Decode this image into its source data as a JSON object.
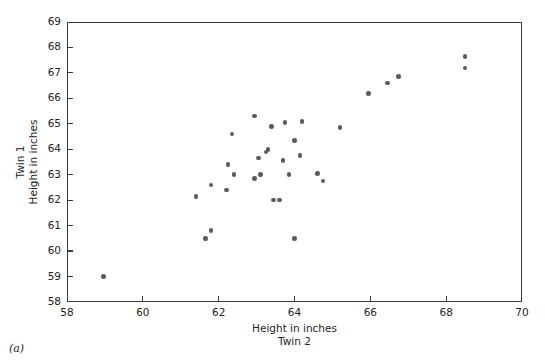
{
  "figure": {
    "caption": "(a)",
    "point_color": "#5a5a5e",
    "frame_color": "#3a3a3a"
  },
  "axes": {
    "x": {
      "label_line1": "Height in inches",
      "label_line2": "Twin 2",
      "ticks": [
        "58",
        "60",
        "62",
        "64",
        "66",
        "68",
        "70"
      ],
      "min": 58,
      "max": 70
    },
    "y": {
      "label_line1": "Twin 1",
      "label_line2": "Height in inches",
      "ticks": [
        "58",
        "59",
        "60",
        "61",
        "62",
        "63",
        "64",
        "65",
        "66",
        "67",
        "68",
        "69"
      ],
      "min": 58,
      "max": 69
    }
  },
  "chart_data": {
    "type": "scatter",
    "title": "",
    "xlabel": "Height in inches / Twin 2",
    "ylabel": "Twin 1 / Height in inches",
    "xlim": [
      58,
      70
    ],
    "ylim": [
      58,
      69
    ],
    "xticks": [
      58,
      60,
      62,
      64,
      66,
      68,
      70
    ],
    "yticks": [
      58,
      59,
      60,
      61,
      62,
      63,
      64,
      65,
      66,
      67,
      68,
      69
    ],
    "grid": false,
    "legend": null,
    "series": [
      {
        "name": "Twin heights",
        "marker": "circle",
        "color": "#5a5a5e",
        "points": [
          [
            58.97,
            59.0
          ],
          [
            61.4,
            62.15
          ],
          [
            61.65,
            60.5
          ],
          [
            61.8,
            60.8
          ],
          [
            61.8,
            62.6
          ],
          [
            62.2,
            62.4
          ],
          [
            62.25,
            63.4
          ],
          [
            62.35,
            64.6
          ],
          [
            62.4,
            63.0
          ],
          [
            62.95,
            65.3
          ],
          [
            62.95,
            62.85
          ],
          [
            63.05,
            63.65
          ],
          [
            63.1,
            63.0
          ],
          [
            63.25,
            63.9
          ],
          [
            63.3,
            64.0
          ],
          [
            63.4,
            64.9
          ],
          [
            63.45,
            62.0
          ],
          [
            63.6,
            62.0
          ],
          [
            63.7,
            63.55
          ],
          [
            63.75,
            65.05
          ],
          [
            63.85,
            63.0
          ],
          [
            64.0,
            64.35
          ],
          [
            64.0,
            60.5
          ],
          [
            64.15,
            63.75
          ],
          [
            64.2,
            65.1
          ],
          [
            64.6,
            63.05
          ],
          [
            64.75,
            62.75
          ],
          [
            65.2,
            64.85
          ],
          [
            65.95,
            66.2
          ],
          [
            66.45,
            66.6
          ],
          [
            66.75,
            66.85
          ],
          [
            68.5,
            67.65
          ],
          [
            68.5,
            67.2
          ]
        ]
      }
    ]
  }
}
